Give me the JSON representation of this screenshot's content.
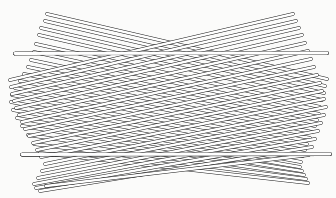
{
  "figure": {
    "type": "line-art-illustration",
    "canvas": {
      "width": 336,
      "height": 198
    },
    "colors": {
      "background": "#fbfbfa",
      "stroke": "#1a1a1a",
      "fill": "#ffffff"
    },
    "style": {
      "stroke_width": 0.85,
      "rod_thickness": 2.6,
      "line_cap": "round",
      "line_join": "round"
    },
    "counts": {
      "total_rods": 40,
      "descending_rods": 19,
      "ascending_rods": 19,
      "horizontal_rods": 2
    },
    "waist": {
      "x": 168,
      "y": 103
    },
    "rods": [
      {
        "name": "horizontal-rod-upper",
        "x1": 15,
        "y1": 53.5,
        "x2": 327,
        "y2": 53.0,
        "thickness": 2.9,
        "group": "horizontal"
      },
      {
        "name": "horizontal-rod-lower",
        "x1": 22,
        "y1": 154.5,
        "x2": 330,
        "y2": 154.0,
        "thickness": 2.9,
        "group": "horizontal"
      },
      {
        "name": "desc-rod-01",
        "x1": 47,
        "y1": 14,
        "x2": 327,
        "y2": 79,
        "thickness": 2.6,
        "group": "descending"
      },
      {
        "name": "desc-rod-02",
        "x1": 45,
        "y1": 21,
        "x2": 325,
        "y2": 86,
        "thickness": 2.6,
        "group": "descending"
      },
      {
        "name": "desc-rod-03",
        "x1": 41,
        "y1": 28,
        "x2": 324,
        "y2": 93,
        "thickness": 2.6,
        "group": "descending"
      },
      {
        "name": "desc-rod-04",
        "x1": 39,
        "y1": 35,
        "x2": 322,
        "y2": 100,
        "thickness": 2.6,
        "group": "descending"
      },
      {
        "name": "desc-rod-05",
        "x1": 36,
        "y1": 44,
        "x2": 320,
        "y2": 107,
        "thickness": 2.6,
        "group": "descending"
      },
      {
        "name": "desc-rod-06",
        "x1": 34,
        "y1": 52,
        "x2": 319,
        "y2": 114,
        "thickness": 2.6,
        "group": "descending"
      },
      {
        "name": "desc-rod-07",
        "x1": 31,
        "y1": 60,
        "x2": 317,
        "y2": 120,
        "thickness": 2.6,
        "group": "descending"
      },
      {
        "name": "desc-rod-08",
        "x1": 28,
        "y1": 67,
        "x2": 315,
        "y2": 126,
        "thickness": 2.6,
        "group": "descending"
      },
      {
        "name": "desc-rod-09",
        "x1": 24,
        "y1": 74,
        "x2": 312,
        "y2": 132,
        "thickness": 2.6,
        "group": "descending"
      },
      {
        "name": "desc-rod-10",
        "x1": 20,
        "y1": 81,
        "x2": 310,
        "y2": 138,
        "thickness": 2.6,
        "group": "descending"
      },
      {
        "name": "desc-rod-11",
        "x1": 15,
        "y1": 88,
        "x2": 307,
        "y2": 144,
        "thickness": 2.6,
        "group": "descending"
      },
      {
        "name": "desc-rod-12",
        "x1": 12,
        "y1": 95,
        "x2": 305,
        "y2": 150,
        "thickness": 2.6,
        "group": "descending"
      },
      {
        "name": "desc-rod-13",
        "x1": 11,
        "y1": 102,
        "x2": 303,
        "y2": 156,
        "thickness": 2.6,
        "group": "descending"
      },
      {
        "name": "desc-rod-14",
        "x1": 13,
        "y1": 110,
        "x2": 301,
        "y2": 162,
        "thickness": 2.6,
        "group": "descending"
      },
      {
        "name": "desc-rod-15",
        "x1": 17,
        "y1": 118,
        "x2": 300,
        "y2": 167,
        "thickness": 2.6,
        "group": "descending"
      },
      {
        "name": "desc-rod-16",
        "x1": 22,
        "y1": 126,
        "x2": 302,
        "y2": 171,
        "thickness": 2.6,
        "group": "descending"
      },
      {
        "name": "desc-rod-17",
        "x1": 28,
        "y1": 135,
        "x2": 304,
        "y2": 175,
        "thickness": 2.6,
        "group": "descending"
      },
      {
        "name": "desc-rod-18",
        "x1": 34,
        "y1": 144,
        "x2": 306,
        "y2": 179,
        "thickness": 2.6,
        "group": "descending"
      },
      {
        "name": "desc-rod-19",
        "x1": 40,
        "y1": 153,
        "x2": 308,
        "y2": 183,
        "thickness": 2.6,
        "group": "descending"
      },
      {
        "name": "asc-rod-01",
        "x1": 10,
        "y1": 80,
        "x2": 293,
        "y2": 14,
        "thickness": 2.6,
        "group": "ascending"
      },
      {
        "name": "asc-rod-02",
        "x1": 11,
        "y1": 87,
        "x2": 296,
        "y2": 21,
        "thickness": 2.6,
        "group": "ascending"
      },
      {
        "name": "asc-rod-03",
        "x1": 12,
        "y1": 94,
        "x2": 299,
        "y2": 28,
        "thickness": 2.6,
        "group": "ascending"
      },
      {
        "name": "asc-rod-04",
        "x1": 14,
        "y1": 101,
        "x2": 302,
        "y2": 35,
        "thickness": 2.6,
        "group": "ascending"
      },
      {
        "name": "asc-rod-05",
        "x1": 16,
        "y1": 108,
        "x2": 305,
        "y2": 43,
        "thickness": 2.6,
        "group": "ascending"
      },
      {
        "name": "asc-rod-06",
        "x1": 19,
        "y1": 115,
        "x2": 308,
        "y2": 51,
        "thickness": 2.6,
        "group": "ascending"
      },
      {
        "name": "asc-rod-07",
        "x1": 22,
        "y1": 122,
        "x2": 311,
        "y2": 59,
        "thickness": 2.6,
        "group": "ascending"
      },
      {
        "name": "asc-rod-08",
        "x1": 25,
        "y1": 129,
        "x2": 314,
        "y2": 67,
        "thickness": 2.6,
        "group": "ascending"
      },
      {
        "name": "asc-rod-09",
        "x1": 29,
        "y1": 136,
        "x2": 317,
        "y2": 75,
        "thickness": 2.6,
        "group": "ascending"
      },
      {
        "name": "asc-rod-10",
        "x1": 33,
        "y1": 143,
        "x2": 320,
        "y2": 83,
        "thickness": 2.6,
        "group": "ascending"
      },
      {
        "name": "asc-rod-11",
        "x1": 37,
        "y1": 150,
        "x2": 322,
        "y2": 91,
        "thickness": 2.6,
        "group": "ascending"
      },
      {
        "name": "asc-rod-12",
        "x1": 41,
        "y1": 157,
        "x2": 324,
        "y2": 99,
        "thickness": 2.6,
        "group": "ascending"
      },
      {
        "name": "asc-rod-13",
        "x1": 45,
        "y1": 164,
        "x2": 326,
        "y2": 107,
        "thickness": 2.6,
        "group": "ascending"
      },
      {
        "name": "asc-rod-14",
        "x1": 42,
        "y1": 171,
        "x2": 324,
        "y2": 115,
        "thickness": 2.6,
        "group": "ascending"
      },
      {
        "name": "asc-rod-15",
        "x1": 38,
        "y1": 178,
        "x2": 321,
        "y2": 123,
        "thickness": 2.6,
        "group": "ascending"
      },
      {
        "name": "asc-rod-16",
        "x1": 34,
        "y1": 184,
        "x2": 318,
        "y2": 131,
        "thickness": 2.6,
        "group": "ascending"
      },
      {
        "name": "asc-rod-17",
        "x1": 36,
        "y1": 188,
        "x2": 315,
        "y2": 139,
        "thickness": 2.6,
        "group": "ascending"
      },
      {
        "name": "asc-rod-18",
        "x1": 40,
        "y1": 191,
        "x2": 312,
        "y2": 147,
        "thickness": 2.6,
        "group": "ascending"
      },
      {
        "name": "asc-rod-19",
        "x1": 46,
        "y1": 186,
        "x2": 309,
        "y2": 155,
        "thickness": 2.6,
        "group": "ascending"
      }
    ]
  }
}
